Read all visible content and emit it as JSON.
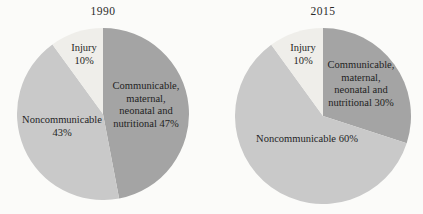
{
  "figure": {
    "background": "#fbfbf9",
    "label_text_color": "#1f1f1f",
    "title_text_color": "#2a2a2a"
  },
  "colors": {
    "communicable": "#a4a4a4",
    "noncommunicable": "#c9c9c9",
    "injury": "#efeeea"
  },
  "chart_data": [
    {
      "type": "pie",
      "title": "1990",
      "start_angle_deg": 0,
      "direction": "clockwise",
      "legend_position": "none",
      "slices": [
        {
          "label": "Communicable, maternal, neonatal and nutritional",
          "value_pct": 47,
          "color_key": "communicable",
          "label_lines": [
            "Communicable,",
            "maternal,",
            "neonatal and",
            "nutritional 47%"
          ]
        },
        {
          "label": "Noncommunicable",
          "value_pct": 43,
          "color_key": "noncommunicable",
          "label_lines": [
            "Noncommunicable",
            "43%"
          ]
        },
        {
          "label": "Injury",
          "value_pct": 10,
          "color_key": "injury",
          "label_lines": [
            "Injury",
            "10%"
          ]
        }
      ]
    },
    {
      "type": "pie",
      "title": "2015",
      "start_angle_deg": 0,
      "direction": "clockwise",
      "legend_position": "none",
      "slices": [
        {
          "label": "Communicable, maternal, neonatal and nutritional",
          "value_pct": 30,
          "color_key": "communicable",
          "label_lines": [
            "Communicable,",
            "maternal,",
            "neonatal and",
            "nutritional 30%"
          ]
        },
        {
          "label": "Noncommunicable",
          "value_pct": 60,
          "color_key": "noncommunicable",
          "label_lines": [
            "Noncommunicable 60%"
          ]
        },
        {
          "label": "Injury",
          "value_pct": 10,
          "color_key": "injury",
          "label_lines": [
            "Injury",
            "10%"
          ]
        }
      ]
    }
  ]
}
